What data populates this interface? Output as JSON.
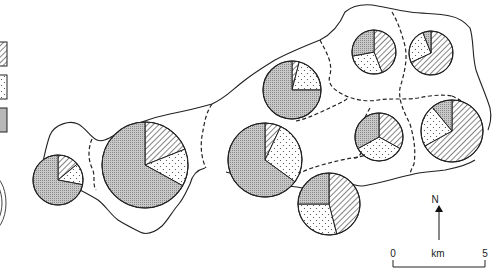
{
  "legend": {
    "items": [
      {
        "pattern": "hatched",
        "label": ""
      },
      {
        "pattern": "dotted",
        "label": ""
      },
      {
        "pattern": "grid",
        "label": ""
      }
    ]
  },
  "north_arrow": {
    "label": "N"
  },
  "scale_bar": {
    "start": "0",
    "unit": "km",
    "end": "5"
  },
  "colors": {
    "line": "#222222",
    "grid_fill": "#bdbdbd",
    "background": "#ffffff"
  },
  "chart_data": {
    "type": "pie",
    "title": "",
    "categories": [
      "hatched",
      "dotted",
      "grid"
    ],
    "pies": [
      {
        "id": 1,
        "cx": 58,
        "cy": 180,
        "r": 25,
        "values": [
          14,
          14,
          72
        ]
      },
      {
        "id": 2,
        "cx": 145,
        "cy": 165,
        "r": 43,
        "values": [
          19,
          14,
          67
        ]
      },
      {
        "id": 3,
        "cx": 292,
        "cy": 90,
        "r": 29,
        "values": [
          4,
          21,
          75
        ]
      },
      {
        "id": 4,
        "cx": 265,
        "cy": 160,
        "r": 37,
        "values": [
          7,
          28,
          65
        ]
      },
      {
        "id": 5,
        "cx": 374,
        "cy": 52,
        "r": 22,
        "values": [
          44,
          28,
          28
        ]
      },
      {
        "id": 6,
        "cx": 431,
        "cy": 53,
        "r": 22,
        "values": [
          68,
          26,
          6
        ]
      },
      {
        "id": 7,
        "cx": 379,
        "cy": 137,
        "r": 24,
        "values": [
          33,
          34,
          33
        ]
      },
      {
        "id": 8,
        "cx": 452,
        "cy": 131,
        "r": 31,
        "values": [
          67,
          22,
          11
        ]
      },
      {
        "id": 9,
        "cx": 329,
        "cy": 204,
        "r": 31,
        "values": [
          46,
          29,
          25
        ]
      }
    ]
  }
}
